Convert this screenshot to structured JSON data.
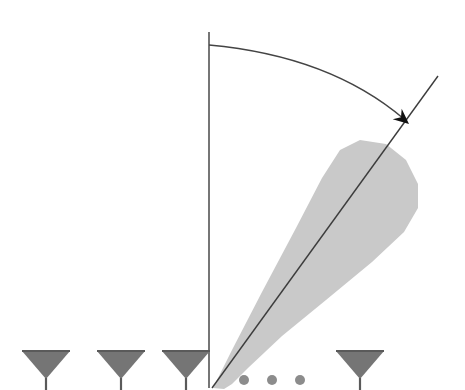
{
  "figure": {
    "title": "",
    "width": 465,
    "height": 390,
    "background_color": "#ffffff"
  },
  "colors": {
    "background": "#ffffff",
    "lobe_fill": "#c9c9c9",
    "antenna_fill": "#757575",
    "antenna_edge": "#5a5a5a",
    "line_stroke": "#3c3c3c",
    "arc_stroke": "#444444",
    "arrow_fill": "#111111",
    "dot_fill": "#8c8c8c"
  },
  "chart_data": {
    "type": "diagram",
    "title": "",
    "subtitle": "",
    "xlabel": "",
    "ylabel": "",
    "origin": {
      "x": 212,
      "y": 388
    },
    "boresight_line": {
      "name": "boresight-reference",
      "x": 209,
      "y_top": 32,
      "y_bottom": 388,
      "stroke_width": 1.4
    },
    "steering_line": {
      "name": "beam-axis",
      "x1": 212,
      "y1": 388,
      "x2": 438,
      "y2": 76,
      "stroke_width": 1.4,
      "angle_from_boresight_deg": 36
    },
    "angle_arc": {
      "name": "steering-angle-arc",
      "start": {
        "x": 209,
        "y": 45
      },
      "control": {
        "x": 330,
        "y": 56
      },
      "end": {
        "x": 404,
        "y": 119
      },
      "radius_px": 344,
      "stroke_width": 1.3
    },
    "arrow_head": {
      "name": "arc-arrowhead",
      "tip": {
        "x": 409,
        "y": 124
      },
      "size_px": 17
    },
    "main_lobe": {
      "name": "main-lobe",
      "fill": "#c9c9c9",
      "apex": {
        "x": 213,
        "y": 388
      },
      "tip_top": {
        "x": 352,
        "y": 140
      },
      "right_extent": {
        "x": 419,
        "y": 207
      },
      "lower_edge_end": {
        "x": 238,
        "y": 388
      },
      "outline_points": [
        [
          213,
          388
        ],
        [
          232,
          350
        ],
        [
          262,
          292
        ],
        [
          296,
          228
        ],
        [
          322,
          178
        ],
        [
          340,
          150
        ],
        [
          360,
          140
        ],
        [
          386,
          144
        ],
        [
          406,
          160
        ],
        [
          418,
          184
        ],
        [
          418,
          208
        ],
        [
          404,
          232
        ],
        [
          372,
          262
        ],
        [
          326,
          300
        ],
        [
          282,
          336
        ],
        [
          248,
          368
        ],
        [
          232,
          384
        ],
        [
          224,
          389
        ]
      ]
    },
    "antenna_elements": [
      {
        "id": 1,
        "label": "",
        "cx": 46,
        "top_y": 351,
        "half_width": 24,
        "height": 28,
        "stem_height": 12
      },
      {
        "id": 2,
        "label": "",
        "cx": 121,
        "top_y": 351,
        "half_width": 24,
        "height": 28,
        "stem_height": 12
      },
      {
        "id": 3,
        "label": "",
        "cx": 186,
        "top_y": 351,
        "half_width": 24,
        "height": 28,
        "stem_height": 12
      },
      {
        "id": 4,
        "label": "",
        "cx": 360,
        "top_y": 351,
        "half_width": 24,
        "height": 28,
        "stem_height": 12
      }
    ],
    "ellipsis_dots": [
      {
        "cx": 244,
        "cy": 380,
        "r": 5
      },
      {
        "cx": 272,
        "cy": 380,
        "r": 5
      },
      {
        "cx": 300,
        "cy": 380,
        "r": 5
      }
    ],
    "annotations": []
  }
}
